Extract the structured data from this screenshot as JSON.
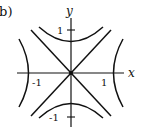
{
  "figure": {
    "panel_label": "(b)",
    "x_axis_label": "x",
    "y_axis_label": "y",
    "x_ticks": [
      {
        "value": -1,
        "label": "-1"
      },
      {
        "value": 1,
        "label": "1"
      }
    ],
    "y_ticks": [
      {
        "value": 1,
        "label": "1"
      },
      {
        "value": -1,
        "label": "-1"
      }
    ],
    "curves": [
      {
        "name": "asymptote y=x",
        "type": "line"
      },
      {
        "name": "asymptote y=-x",
        "type": "line"
      },
      {
        "name": "hyperbola x^2 - y^2 = 1 (left/right branches)",
        "type": "hyperbola"
      },
      {
        "name": "hyperbola y^2 - x^2 = 1 (upper/lower branches)",
        "type": "hyperbola"
      }
    ],
    "colors": {
      "stroke": "#111111",
      "background": "#ffffff"
    }
  }
}
